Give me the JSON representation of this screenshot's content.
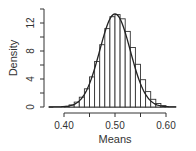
{
  "chart_data": {
    "type": "bar",
    "subtype": "histogram_with_density_curve",
    "title": "",
    "xlabel": "Means",
    "ylabel": "Density",
    "xlim": [
      0.37,
      0.62
    ],
    "ylim": [
      0,
      14
    ],
    "x_ticks": [
      0.4,
      0.45,
      0.5,
      0.55,
      0.6
    ],
    "x_tick_labels": [
      "0.40",
      "",
      "0.50",
      "",
      "0.60"
    ],
    "y_ticks": [
      0,
      2,
      4,
      6,
      8,
      10,
      12,
      14
    ],
    "y_tick_labels": [
      "0",
      "",
      "4",
      "",
      "8",
      "",
      "12",
      ""
    ],
    "bin_width": 0.01,
    "bin_starts": [
      0.4,
      0.41,
      0.42,
      0.43,
      0.44,
      0.45,
      0.46,
      0.47,
      0.48,
      0.49,
      0.5,
      0.51,
      0.52,
      0.53,
      0.54,
      0.55,
      0.56,
      0.57,
      0.58,
      0.59
    ],
    "values": [
      0.1,
      0.3,
      0.7,
      1.4,
      2.6,
      4.3,
      6.5,
      8.9,
      11.2,
      12.9,
      13.2,
      12.6,
      10.8,
      8.5,
      6.1,
      3.9,
      2.2,
      1.1,
      0.5,
      0.2
    ],
    "density_curve": {
      "distribution": "normal",
      "mean": 0.5,
      "sd": 0.03
    },
    "grid": false,
    "legend": null
  }
}
